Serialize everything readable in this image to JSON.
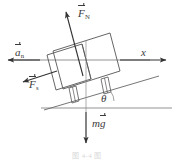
{
  "figure": {
    "type": "free-body-diagram",
    "caption": "图 4-4 图",
    "background_color": "#ffffff",
    "line_color": "#555555",
    "label_color": "#3a3a3a",
    "labels": {
      "normal_force": {
        "symbol": "F",
        "subscript": "N",
        "vector": true,
        "text": "F_N"
      },
      "acceleration": {
        "symbol": "a",
        "subscript": "n",
        "vector": true,
        "text": "a_n"
      },
      "x_axis": {
        "symbol": "x",
        "subscript": "",
        "vector": false,
        "text": "x"
      },
      "friction_force": {
        "symbol": "F",
        "subscript": "s",
        "vector": true,
        "text": "F_s"
      },
      "incline_angle": {
        "symbol": "θ",
        "subscript": "",
        "vector": false,
        "text": "θ"
      },
      "weight": {
        "symbol": "mg",
        "subscript": "",
        "vector": true,
        "text": "mg"
      }
    },
    "vectors": [
      {
        "name": "normal-force-arrow",
        "label": "F_N",
        "direction": "up-left perpendicular to incline"
      },
      {
        "name": "acceleration-arrow",
        "label": "a_n",
        "direction": "left along horizontal axis"
      },
      {
        "name": "x-axis-arrow",
        "label": "x",
        "direction": "right along horizontal axis"
      },
      {
        "name": "friction-force-arrow",
        "label": "F_s",
        "direction": "down-left parallel to incline"
      },
      {
        "name": "weight-arrow",
        "label": "mg",
        "direction": "straight down"
      }
    ],
    "angle_value_text": "θ"
  }
}
